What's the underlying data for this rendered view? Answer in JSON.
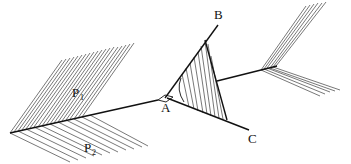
{
  "diagram": {
    "type": "geometry-dihedral-angle",
    "labels": {
      "A": "A",
      "B": "B",
      "C": "C",
      "P1": "P",
      "P1_sub": "1",
      "P2": "P",
      "P2_sub": "2"
    },
    "colors": {
      "line": "#111111",
      "hatch": "#555555",
      "background": "#ffffff"
    }
  }
}
